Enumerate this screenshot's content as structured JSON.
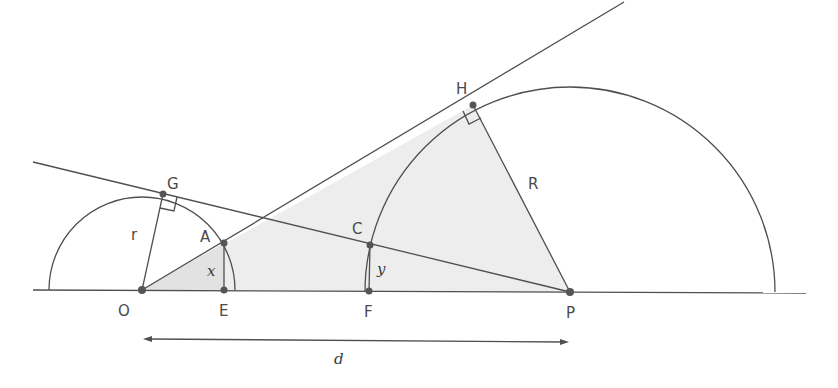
{
  "figure": {
    "colors": {
      "stroke": "#4f4f4f",
      "shade": "#ececec",
      "point": "#555555",
      "label": "#4a4a4a"
    }
  },
  "points": {
    "O": {
      "label": "O",
      "x": 142,
      "y": 290
    },
    "E": {
      "label": "E",
      "x": 224,
      "y": 290
    },
    "F": {
      "label": "F",
      "x": 369,
      "y": 291
    },
    "P": {
      "label": "P",
      "x": 570,
      "y": 292
    },
    "A": {
      "label": "A",
      "x": 224,
      "y": 243
    },
    "C": {
      "label": "C",
      "x": 370,
      "y": 245
    },
    "G": {
      "label": "G",
      "x": 163,
      "y": 194
    },
    "H": {
      "label": "H",
      "x": 473,
      "y": 105
    }
  },
  "labels": {
    "r": "r",
    "R": "R",
    "x": "x",
    "y": "y",
    "d": "d"
  }
}
